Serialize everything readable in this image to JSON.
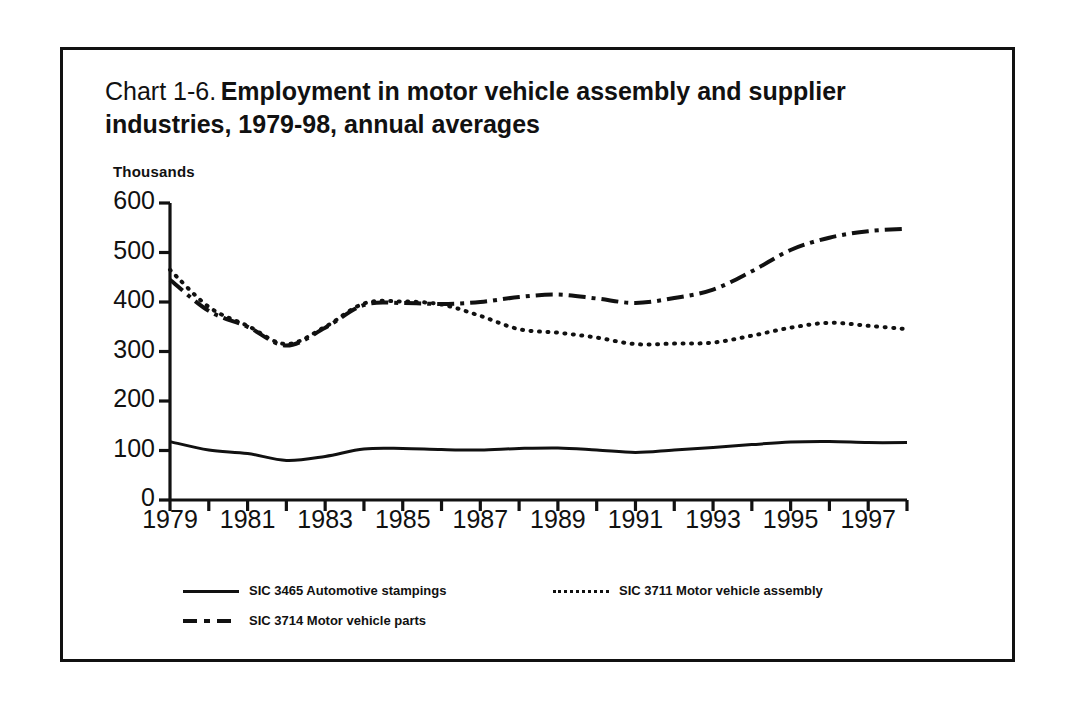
{
  "figure": {
    "label": "Chart 1-6.",
    "title": "Employment in motor vehicle assembly and supplier industries, 1979-98, annual averages"
  },
  "axis_note": "Thousands",
  "legend": [
    {
      "style": "solid",
      "label": "SIC 3465 Automotive stampings"
    },
    {
      "style": "dotted",
      "label": "SIC 3711 Motor vehicle assembly"
    },
    {
      "style": "dashdot",
      "label": "SIC 3714 Motor vehicle parts"
    }
  ],
  "chart_data": {
    "type": "line",
    "title": "Chart 1-6. Employment in motor vehicle assembly and supplier industries, 1979-98, annual averages",
    "xlabel": "",
    "ylabel": "Thousands",
    "ylim": [
      0,
      600
    ],
    "yticks": [
      0,
      100,
      200,
      300,
      400,
      500,
      600
    ],
    "ytick_labels": [
      "0",
      "100",
      "200",
      "300",
      "400",
      "500",
      "600"
    ],
    "xlim": [
      1979,
      1998
    ],
    "xticks": [
      1979,
      1980,
      1981,
      1982,
      1983,
      1984,
      1985,
      1986,
      1987,
      1988,
      1989,
      1990,
      1991,
      1992,
      1993,
      1994,
      1995,
      1996,
      1997,
      1998
    ],
    "xtick_labels": [
      "1979",
      "",
      "1981",
      "",
      "1983",
      "",
      "1985",
      "",
      "1987",
      "",
      "1989",
      "",
      "1991",
      "",
      "1993",
      "",
      "1995",
      "",
      "1997",
      ""
    ],
    "grid": false,
    "legend_position": "below-plot",
    "x": [
      1979,
      1980,
      1981,
      1982,
      1983,
      1984,
      1985,
      1986,
      1987,
      1988,
      1989,
      1990,
      1991,
      1992,
      1993,
      1994,
      1995,
      1996,
      1997,
      1998
    ],
    "series": [
      {
        "name": "SIC 3465 Automotive stampings",
        "style": "solid",
        "values": [
          118,
          101,
          94,
          80,
          88,
          103,
          104,
          102,
          101,
          104,
          105,
          101,
          96,
          101,
          106,
          112,
          117,
          118,
          116,
          116
        ]
      },
      {
        "name": "SIC 3711 Motor vehicle assembly",
        "style": "dotted",
        "values": [
          465,
          390,
          352,
          315,
          350,
          397,
          401,
          395,
          372,
          345,
          338,
          328,
          315,
          316,
          318,
          332,
          348,
          358,
          352,
          345
        ]
      },
      {
        "name": "SIC 3714 Motor vehicle parts",
        "style": "dashdot",
        "values": [
          445,
          382,
          350,
          312,
          348,
          394,
          398,
          396,
          400,
          410,
          415,
          407,
          398,
          408,
          425,
          462,
          505,
          530,
          543,
          548
        ]
      }
    ]
  }
}
